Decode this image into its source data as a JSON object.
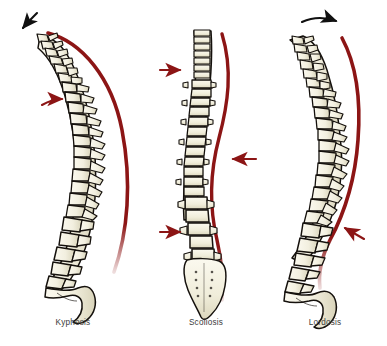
{
  "figure": {
    "background_color": "#ffffff",
    "panel_count": 3
  },
  "colors": {
    "bone_fill": "#f2efdf",
    "bone_fill_shadow": "#ded9c0",
    "bone_outline": "#15110d",
    "reference_line": "#8c1515",
    "reference_line_dark": "#7d1111",
    "red_arrow": "#8c1515",
    "black_arrow": "#111111",
    "label_text": "#3a3a3a",
    "background": "#ffffff"
  },
  "panels": [
    {
      "id": "kyphosis",
      "label": "Kyphosis",
      "view": "lateral",
      "description": "Exaggerated outward rounding of the thoracic spine",
      "label_position": {
        "x": 73,
        "y": 325
      },
      "reference_line": {
        "name": "posture-reference-line",
        "color": "#8c1515",
        "shape": "convex-right-arc"
      },
      "arrows": [
        {
          "name": "kyphosis-black-arrow",
          "color": "#111111",
          "style": "curved",
          "direction": "down-left",
          "position": {
            "x": 28,
            "y": 26
          }
        },
        {
          "name": "kyphosis-red-arrow",
          "color": "#8c1515",
          "style": "curved",
          "direction": "right",
          "position": {
            "x": 55,
            "y": 103
          }
        }
      ]
    },
    {
      "id": "scoliosis",
      "label": "Scoliosis",
      "view": "frontal",
      "description": "Sideways S-shaped lateral curvature of the spine",
      "label_position": {
        "x": 206,
        "y": 325
      },
      "reference_line": {
        "name": "posture-reference-line",
        "color": "#8c1515",
        "shape": "s-curve"
      },
      "arrows": [
        {
          "name": "scoliosis-red-arrow-upper-left",
          "color": "#8c1515",
          "style": "straight",
          "direction": "right",
          "position": {
            "x": 166,
            "y": 70
          }
        },
        {
          "name": "scoliosis-red-arrow-middle-right",
          "color": "#8c1515",
          "style": "straight",
          "direction": "left",
          "position": {
            "x": 243,
            "y": 159
          }
        },
        {
          "name": "scoliosis-red-arrow-lower-left",
          "color": "#8c1515",
          "style": "straight",
          "direction": "right",
          "position": {
            "x": 166,
            "y": 231
          }
        }
      ]
    },
    {
      "id": "lordosis",
      "label": "Lordosis",
      "view": "lateral",
      "description": "Exaggerated inward curve of the lumbar spine",
      "label_position": {
        "x": 325,
        "y": 325
      },
      "reference_line": {
        "name": "posture-reference-line",
        "color": "#8c1515",
        "shape": "concave-lower-curve"
      },
      "arrows": [
        {
          "name": "lordosis-black-arrow",
          "color": "#111111",
          "style": "curved",
          "direction": "right",
          "position": {
            "x": 318,
            "y": 22
          }
        },
        {
          "name": "lordosis-red-arrow",
          "color": "#8c1515",
          "style": "straight",
          "direction": "left",
          "position": {
            "x": 340,
            "y": 228
          }
        }
      ]
    }
  ],
  "anatomy": {
    "regions": [
      "cervical",
      "thoracic",
      "lumbar",
      "sacrum",
      "coccyx"
    ],
    "vertebra_counts": {
      "cervical": 7,
      "thoracic": 12,
      "lumbar": 5
    }
  }
}
